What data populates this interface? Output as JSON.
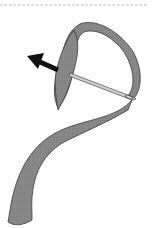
{
  "illustration": {
    "subject": "ribbon threaded through needle",
    "colors": {
      "ribbon_fill": "#8a8a8a",
      "ribbon_stroke": "#3a3a3a",
      "needle_fill": "#cfcfcf",
      "needle_stroke": "#4a4a4a",
      "arrow": "#111111",
      "dashed_line": "#b5b5b5",
      "background": "#ffffff"
    },
    "elements": {
      "top_divider": "dashed-line",
      "ribbon": "ribbon-shape",
      "needle": "needle",
      "direction_arrow": "arrow-pull-left"
    }
  }
}
